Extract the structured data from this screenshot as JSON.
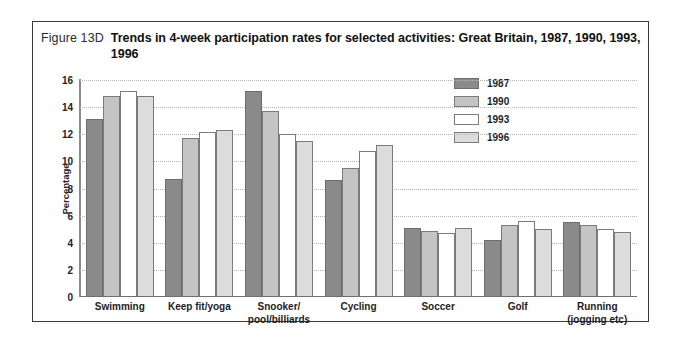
{
  "figure": {
    "number": "Figure 13D",
    "title": "Trends in 4-week participation rates for selected activities: Great Britain, 1987, 1990, 1993, 1996"
  },
  "colors": {
    "series_1987": "#8a8a8a",
    "series_1990": "#c4c4c4",
    "series_1993": "#ffffff",
    "series_1996": "#dcdcdc",
    "gridline": "#b4b4b4",
    "axis": "#6e6e6e",
    "frame": "#3a3a3a"
  },
  "chart_data": {
    "type": "bar",
    "title": "Trends in 4-week participation rates for selected activities: Great Britain, 1987, 1990, 1993, 1996",
    "xlabel": "",
    "ylabel": "Percentage",
    "ylim": [
      0,
      16
    ],
    "yticks": [
      16,
      14,
      12,
      10,
      8,
      6,
      4,
      2,
      0
    ],
    "grid": true,
    "legend_position": "top-right",
    "categories": [
      "Swimming",
      "Keep fit/yoga",
      "Snooker/\npool/billiards",
      "Cycling",
      "Soccer",
      "Golf",
      "Running\n(jogging etc)"
    ],
    "series": [
      {
        "name": "1987",
        "values": [
          13.1,
          8.7,
          15.2,
          8.6,
          5.1,
          4.2,
          5.5
        ]
      },
      {
        "name": "1990",
        "values": [
          14.8,
          11.7,
          13.7,
          9.5,
          4.9,
          5.3,
          5.3
        ]
      },
      {
        "name": "1993",
        "values": [
          15.2,
          12.2,
          12.0,
          10.8,
          4.7,
          5.6,
          5.0
        ]
      },
      {
        "name": "1996",
        "values": [
          14.8,
          12.3,
          11.5,
          11.2,
          5.1,
          5.0,
          4.8
        ]
      }
    ]
  }
}
